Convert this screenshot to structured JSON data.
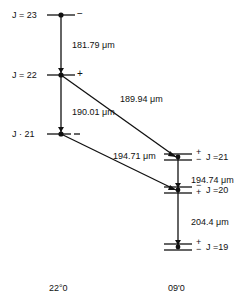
{
  "diagram": {
    "left_column": {
      "label": "22°0",
      "levels": [
        {
          "j_label": "J = 23",
          "parity": "−"
        },
        {
          "j_label": "J = 22",
          "parity": "+"
        },
        {
          "j_label": "J · 21",
          "parity": "− −"
        }
      ]
    },
    "right_column": {
      "label": "09'0",
      "levels": [
        {
          "j_label": "J =21",
          "parity_top": "+",
          "parity_bottom": "−"
        },
        {
          "j_label": "J =20",
          "parity_top": "−",
          "parity_bottom": "+"
        },
        {
          "j_label": "J =19",
          "parity_top": "+",
          "parity_bottom": "−"
        }
      ]
    },
    "transitions": [
      {
        "label": "181.79 μm",
        "from": "J=23",
        "to": "J=22"
      },
      {
        "label": "190.01 μm",
        "from": "J=22",
        "to": "J=21"
      },
      {
        "label": "189.94 μm",
        "from": "J=22 (22°0)",
        "to": "J=21 (09'0)"
      },
      {
        "label": "194.71 μm",
        "from": "J=21 (22°0)",
        "to": "J=20 (09'0)"
      },
      {
        "label": "194.74 μm",
        "from": "J=21",
        "to": "J=20"
      },
      {
        "label": "204.4 μm",
        "from": "J=20",
        "to": "J=19"
      }
    ]
  }
}
